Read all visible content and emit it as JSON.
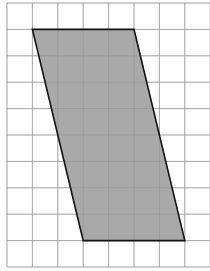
{
  "diagram": {
    "type": "grid-with-parallelogram",
    "grid": {
      "columns": 8,
      "rows": 10,
      "origin_x": 7,
      "origin_y": 3,
      "cell_width": 25.4,
      "cell_height": 26.4,
      "line_color": "#c8c8c8"
    },
    "shape": {
      "name": "parallelogram",
      "fill": "#a9a9a9",
      "stroke": "#111111",
      "vertices_grid": [
        [
          1,
          1
        ],
        [
          5,
          1
        ],
        [
          7,
          9
        ],
        [
          3,
          9
        ]
      ],
      "base_units": 4,
      "height_units": 8
    }
  }
}
